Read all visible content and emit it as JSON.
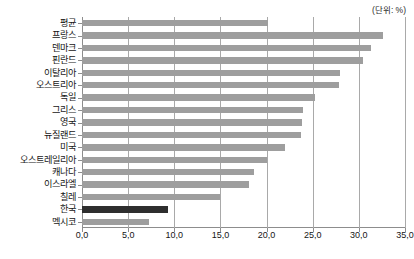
{
  "unit_note": "(단위: %)",
  "chart_data": {
    "type": "bar",
    "orientation": "horizontal",
    "title": "",
    "subtitle": "",
    "xlabel": "",
    "ylabel": "",
    "unit": "(단위: %)",
    "xlim": [
      0.0,
      35.0
    ],
    "xticks": [
      0.0,
      5.0,
      10.0,
      15.0,
      20.0,
      25.0,
      30.0,
      35.0
    ],
    "xtick_labels": [
      "0,0",
      "5,0",
      "10,0",
      "15,0",
      "20,0",
      "25,0",
      "30,0",
      "35,0"
    ],
    "grid": true,
    "grid_axis": "x",
    "legend": false,
    "bar_color": "#9e9e9e",
    "highlight_color": "#2e2e2e",
    "highlight_category": "한국",
    "categories": [
      "평균",
      "프랑스",
      "덴마크",
      "핀란드",
      "이탈리아",
      "오스트리아",
      "독일",
      "그리스",
      "영국",
      "뉴질랜드",
      "미국",
      "오스트레일리아",
      "캐나다",
      "이스라엘",
      "칠레",
      "한국",
      "멕시코"
    ],
    "values": [
      20.2,
      32.6,
      31.3,
      30.5,
      28.0,
      27.8,
      25.3,
      24.0,
      23.8,
      23.7,
      22.0,
      20.0,
      18.6,
      18.1,
      15.0,
      9.3,
      7.3
    ]
  }
}
